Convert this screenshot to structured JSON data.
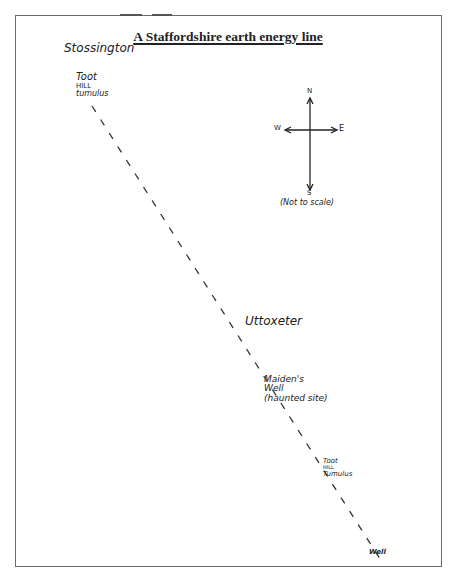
{
  "title": "A Staffordshire earth energy line",
  "labels": {
    "stossington": "Stossington",
    "toot_hill_1_line1": "Toot",
    "toot_hill_1_line2": "HILL",
    "toot_hill_1_line3": "tumulus",
    "uttoxeter": "Uttoxeter",
    "maidens_well_line1": "Maiden's",
    "maidens_well_line2": "Well",
    "maidens_well_line3": "(haunted site)",
    "toot_hill_2_line1": "Toot",
    "toot_hill_2_line2": "HILL",
    "toot_hill_2_line3": "Tumulus",
    "well": "Well"
  },
  "compass": {
    "north": "N",
    "south": "S",
    "east": "E",
    "west": "W",
    "note": "(Not to scale)"
  },
  "energy_line": {
    "style": "dashed",
    "start": [
      92,
      106
    ],
    "end": [
      382,
      562
    ]
  },
  "colors": {
    "ink": "#222222",
    "frame": "#6a6a6a",
    "background": "#ffffff"
  }
}
